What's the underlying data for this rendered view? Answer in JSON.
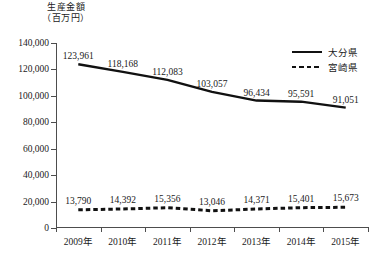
{
  "chart_data": {
    "type": "line",
    "title": "",
    "subtitle": "",
    "xlabel": "",
    "ylabel": "生産金額",
    "ylabel_unit": "（百万円）",
    "categories": [
      "2009年",
      "2010年",
      "2011年",
      "2012年",
      "2013年",
      "2014年",
      "2015年"
    ],
    "ylim": [
      0,
      140000
    ],
    "ytick_values": [
      0,
      20000,
      40000,
      60000,
      80000,
      100000,
      120000,
      140000
    ],
    "ytick_labels": [
      "0",
      "20,000",
      "40,000",
      "60,000",
      "80,000",
      "100,000",
      "120,000",
      "140,000"
    ],
    "grid": false,
    "legend_position": "top-right",
    "series": [
      {
        "name": "大分県",
        "style": "solid",
        "color": "#111111",
        "values": [
          123961,
          118168,
          112083,
          103057,
          96434,
          95591,
          91051
        ],
        "labels": [
          "123,961",
          "118,168",
          "112,083",
          "103,057",
          "96,434",
          "95,591",
          "91,051"
        ]
      },
      {
        "name": "宮崎県",
        "style": "dashed",
        "color": "#111111",
        "values": [
          13790,
          14392,
          15356,
          13046,
          14371,
          15401,
          15673
        ],
        "labels": [
          "13,790",
          "14,392",
          "15,356",
          "13,046",
          "14,371",
          "15,401",
          "15,673"
        ]
      }
    ]
  }
}
